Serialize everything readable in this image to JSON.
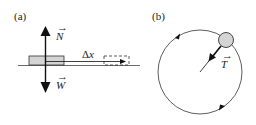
{
  "panel_a": {
    "label": "(a)",
    "normal_force": {
      "symbol": "N",
      "vector_mark": "→"
    },
    "weight": {
      "symbol": "W",
      "vector_mark": "→"
    },
    "displacement": {
      "symbol": "Δx"
    },
    "colors": {
      "ink": "#111111",
      "block_fill": "#d4d4d4"
    }
  },
  "panel_b": {
    "label": "(b)",
    "tension": {
      "symbol": "T",
      "vector_mark": "→"
    },
    "colors": {
      "ink": "#111111",
      "ball_fill": "#d4d4d4"
    }
  }
}
